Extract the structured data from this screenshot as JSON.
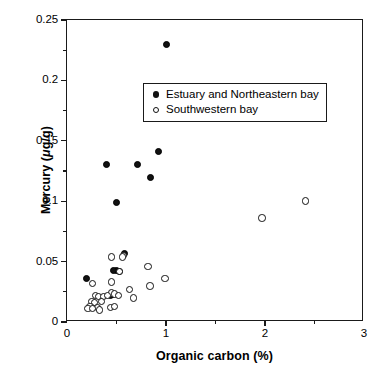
{
  "chart_data": {
    "type": "scatter",
    "title": "",
    "xlabel": "Organic carbon (%)",
    "ylabel": "Mercury (μg/g)",
    "ylabel_parts": {
      "prefix": "Mercury (",
      "mu": "μ",
      "suffix": "g/g)"
    },
    "xlim": [
      0,
      3
    ],
    "ylim": [
      0,
      0.25
    ],
    "xticks": [
      0,
      1,
      2,
      3
    ],
    "xtick_labels": [
      "0",
      "1",
      "2",
      "3"
    ],
    "xminor_ticks": [
      0.5,
      1.5,
      2.5
    ],
    "yticks": [
      0,
      0.05,
      0.1,
      0.15,
      0.2,
      0.25
    ],
    "ytick_labels": [
      "0",
      "0.05",
      "0.1",
      "0.15",
      "0.2",
      "0.25"
    ],
    "yminor_ticks": [
      0.025,
      0.075,
      0.125,
      0.175,
      0.225
    ],
    "grid": false,
    "legend_position": "upper center",
    "series": [
      {
        "name": "Estuary and Northeastern bay",
        "marker": "filled-circle",
        "color": "#111111",
        "points": [
          [
            1.0,
            0.23
          ],
          [
            0.92,
            0.141
          ],
          [
            0.71,
            0.13
          ],
          [
            0.4,
            0.13
          ],
          [
            0.84,
            0.12
          ],
          [
            0.5,
            0.099
          ],
          [
            0.58,
            0.057
          ],
          [
            0.5,
            0.043
          ],
          [
            0.47,
            0.043
          ],
          [
            0.53,
            0.042
          ],
          [
            0.2,
            0.036
          ],
          [
            0.46,
            0.023
          ],
          [
            0.44,
            0.022
          ]
        ]
      },
      {
        "name": "Southwestern bay",
        "marker": "open-circle",
        "color": "#121212",
        "points": [
          [
            2.41,
            0.1
          ],
          [
            1.97,
            0.086
          ],
          [
            0.57,
            0.055
          ],
          [
            0.45,
            0.054
          ],
          [
            0.56,
            0.054
          ],
          [
            0.82,
            0.046
          ],
          [
            0.53,
            0.042
          ],
          [
            0.99,
            0.036
          ],
          [
            0.26,
            0.032
          ],
          [
            0.45,
            0.033
          ],
          [
            0.84,
            0.03
          ],
          [
            0.63,
            0.027
          ],
          [
            0.45,
            0.024
          ],
          [
            0.48,
            0.023
          ],
          [
            0.29,
            0.022
          ],
          [
            0.32,
            0.021
          ],
          [
            0.37,
            0.021
          ],
          [
            0.41,
            0.022
          ],
          [
            0.52,
            0.022
          ],
          [
            0.67,
            0.02
          ],
          [
            0.25,
            0.017
          ],
          [
            0.28,
            0.016
          ],
          [
            0.35,
            0.017
          ],
          [
            0.23,
            0.013
          ],
          [
            0.31,
            0.012
          ],
          [
            0.44,
            0.012
          ],
          [
            0.48,
            0.013
          ],
          [
            0.21,
            0.011
          ],
          [
            0.26,
            0.011
          ],
          [
            0.33,
            0.01
          ]
        ]
      }
    ]
  }
}
